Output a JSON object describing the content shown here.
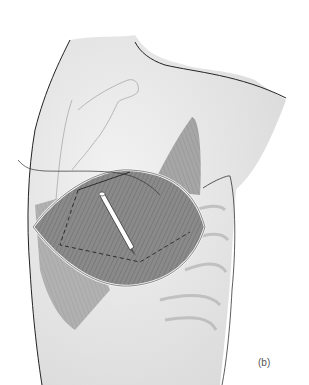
{
  "figure": {
    "panel_label": "(b)",
    "colors": {
      "skin": "#ececec",
      "skin_shadow": "#d6d6d6",
      "outline": "#222222",
      "muscle": "#8a8a8a",
      "muscle_dark": "#6e6e6e",
      "bone": "#bdbdbd",
      "instrument": "#ffffff"
    }
  }
}
